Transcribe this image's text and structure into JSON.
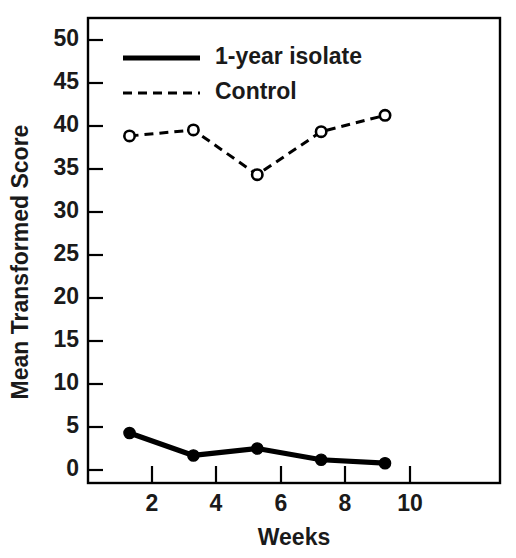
{
  "chart_data": {
    "type": "line",
    "title": "",
    "xlabel": "Weeks",
    "ylabel": "Mean Transformed Score",
    "x": [
      2,
      4,
      6,
      8,
      10
    ],
    "xticklabels": [
      "2",
      "4",
      "6",
      "8",
      "10"
    ],
    "yticks": [
      0,
      5,
      10,
      15,
      20,
      25,
      30,
      35,
      40,
      45,
      50
    ],
    "yticklabels": [
      "0",
      "5",
      "10",
      "15",
      "20",
      "25",
      "30",
      "35",
      "40",
      "45",
      "50"
    ],
    "xlim": [
      0.7,
      13.6
    ],
    "ylim": [
      -1.5,
      52.5
    ],
    "grid": false,
    "legend_position": "upper-left-inside",
    "series": [
      {
        "name": "1-year isolate",
        "values": [
          4.3,
          1.7,
          2.5,
          1.2,
          0.8
        ],
        "linestyle": "solid",
        "marker": "filled-circle",
        "color": "#000000"
      },
      {
        "name": "Control",
        "values": [
          38.8,
          39.5,
          34.3,
          39.3,
          41.2
        ],
        "linestyle": "dashed",
        "marker": "open-circle",
        "color": "#000000"
      }
    ]
  },
  "figure": {
    "background_color": "#ffffff",
    "axis_color": "#000000",
    "text_color": "#1a1a1a"
  },
  "legend": {
    "entries": [
      {
        "label": "1-year isolate"
      },
      {
        "label": "Control"
      }
    ]
  }
}
